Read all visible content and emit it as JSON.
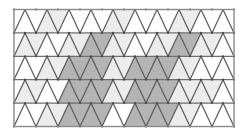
{
  "figure": {
    "type": "geometric-tessellation",
    "background_color": "#ffffff"
  },
  "canvas": {
    "width": 244,
    "height": 133
  },
  "grid": {
    "origin_x": 14,
    "origin_y": 9.5,
    "cell_width": 22,
    "row_height": 23.4,
    "columns": 10,
    "rows": 5,
    "triangles_per_row": 20,
    "border_color": "#8a8a8a",
    "border_width": 1.4,
    "edge_color": "#5a5a5a",
    "edge_width": 1.2,
    "row_line_color": "#6f6f6f",
    "row_line_width": 1.2,
    "vertex_dot_color": "#4a4a4a",
    "vertex_dot_radius": 1.1
  },
  "palette": {
    "white": "#ffffff",
    "light": "#ececec",
    "medium": "#b4b4b4"
  },
  "shading": {
    "legend": "0 = white, 1 = light gray, 2 = medium gray",
    "note": "Each row lists 20 triangles left to right, alternating upward-pointing (even index) and downward-pointing (odd index).",
    "rows": [
      [
        0,
        0,
        1,
        1,
        0,
        0,
        0,
        0,
        1,
        1,
        0,
        0,
        0,
        0,
        1,
        1,
        0,
        0,
        0,
        0
      ],
      [
        1,
        1,
        0,
        0,
        1,
        1,
        2,
        2,
        1,
        1,
        0,
        0,
        1,
        1,
        2,
        2,
        1,
        1,
        0,
        0
      ],
      [
        0,
        0,
        1,
        1,
        2,
        2,
        2,
        2,
        1,
        1,
        2,
        2,
        2,
        2,
        1,
        1,
        0,
        0,
        0,
        0
      ],
      [
        1,
        1,
        0,
        0,
        2,
        2,
        2,
        2,
        1,
        1,
        2,
        2,
        2,
        2,
        1,
        1,
        1,
        1,
        0,
        0
      ],
      [
        0,
        0,
        1,
        1,
        2,
        2,
        2,
        2,
        0,
        0,
        2,
        2,
        2,
        2,
        1,
        1,
        0,
        0,
        0,
        0
      ]
    ]
  }
}
